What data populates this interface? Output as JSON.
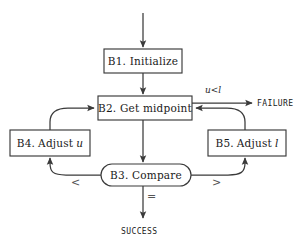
{
  "diagram": {
    "type": "flowchart",
    "stroke_color": "#3a3a3a",
    "text_color": "#1a1a1a",
    "background_color": "#ffffff",
    "nodes": [
      {
        "id": "B1",
        "shape": "rectangle",
        "label": "B1. Initialize",
        "label_prefix": "B1.",
        "label_text": "Initialize",
        "x": 104,
        "y": 49,
        "w": 78,
        "h": 24
      },
      {
        "id": "B2",
        "shape": "rectangle",
        "label": "B2. Get midpoint",
        "label_prefix": "B2.",
        "label_text": "Get midpoint",
        "x": 98,
        "y": 96,
        "w": 94,
        "h": 24
      },
      {
        "id": "B4",
        "shape": "rectangle",
        "label": "B4. Adjust u",
        "label_prefix": "B4.",
        "label_text": "Adjust",
        "label_var": "u",
        "x": 10,
        "y": 130,
        "w": 80,
        "h": 26
      },
      {
        "id": "B5",
        "shape": "rectangle",
        "label": "B5. Adjust l",
        "label_prefix": "B5.",
        "label_text": "Adjust",
        "label_var": "l",
        "x": 208,
        "y": 130,
        "w": 78,
        "h": 26
      },
      {
        "id": "B3",
        "shape": "rounded-oval",
        "label": "B3. Compare",
        "label_prefix": "B3.",
        "label_text": "Compare",
        "x": 101,
        "y": 164,
        "w": 90,
        "h": 22
      }
    ],
    "edge_labels": [
      {
        "id": "fail-cond",
        "text": "u < l",
        "var_u": "u",
        "operator": "<",
        "var_l": "l",
        "x": 205,
        "y": 87
      },
      {
        "id": "less-than",
        "text": "<",
        "x": 71,
        "y": 177
      },
      {
        "id": "greater-than",
        "text": ">",
        "x": 212,
        "y": 177
      },
      {
        "id": "equals",
        "text": "=",
        "x": 149,
        "y": 192
      }
    ],
    "terminals": [
      {
        "id": "failure",
        "text": "FAILURE",
        "x": 257,
        "y": 93
      },
      {
        "id": "success",
        "text": "SUCCESS",
        "x": 122,
        "y": 228
      }
    ],
    "edges": [
      {
        "from": "entry",
        "to": "B1",
        "kind": "arrow-down"
      },
      {
        "from": "B1",
        "to": "B2",
        "kind": "arrow-down"
      },
      {
        "from": "B2",
        "to": "FAILURE",
        "kind": "arrow-right",
        "label": "u < l"
      },
      {
        "from": "B2",
        "to": "B3",
        "kind": "arrow-down"
      },
      {
        "from": "B3",
        "to": "B4",
        "kind": "curve-left-up",
        "label": "<"
      },
      {
        "from": "B4",
        "to": "B2",
        "kind": "curve-up-right"
      },
      {
        "from": "B3",
        "to": "B5",
        "kind": "curve-right-up",
        "label": ">"
      },
      {
        "from": "B5",
        "to": "B2",
        "kind": "curve-up-left"
      },
      {
        "from": "B3",
        "to": "SUCCESS",
        "kind": "arrow-down",
        "label": "="
      }
    ]
  }
}
